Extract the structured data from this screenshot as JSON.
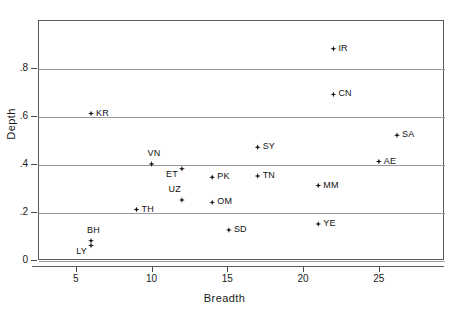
{
  "chart_data": {
    "type": "scatter",
    "title": "",
    "xlabel": "Breadth",
    "ylabel": "Depth",
    "xlim": [
      2.5,
      29.3
    ],
    "ylim": [
      -0.02,
      1.0
    ],
    "grid": "horizontal",
    "legend": "none",
    "xticks": [
      5,
      10,
      15,
      20,
      25
    ],
    "xtick_labels": [
      "5",
      "10",
      "15",
      "20",
      "25"
    ],
    "yticks": [
      0,
      0.2,
      0.4,
      0.6,
      0.8
    ],
    "ytick_labels": [
      "0",
      ".2",
      ".4",
      ".6",
      ".8"
    ],
    "marker": "filled-diamond",
    "marker_color": "#111111",
    "points": [
      {
        "label": "IR",
        "x": 22.0,
        "y": 0.88,
        "anchor": "right"
      },
      {
        "label": "CN",
        "x": 22.0,
        "y": 0.69,
        "anchor": "right"
      },
      {
        "label": "KR",
        "x": 6.0,
        "y": 0.61,
        "anchor": "right"
      },
      {
        "label": "SA",
        "x": 26.2,
        "y": 0.52,
        "anchor": "right"
      },
      {
        "label": "SY",
        "x": 17.0,
        "y": 0.47,
        "anchor": "right"
      },
      {
        "label": "VN",
        "x": 10.0,
        "y": 0.4,
        "anchor": "above"
      },
      {
        "label": "AE",
        "x": 25.0,
        "y": 0.41,
        "anchor": "right"
      },
      {
        "label": "ET",
        "x": 12.0,
        "y": 0.38,
        "anchor": "belowleft"
      },
      {
        "label": "TN",
        "x": 17.0,
        "y": 0.35,
        "anchor": "right"
      },
      {
        "label": "PK",
        "x": 14.0,
        "y": 0.345,
        "anchor": "right"
      },
      {
        "label": "MM",
        "x": 21.0,
        "y": 0.31,
        "anchor": "right"
      },
      {
        "label": "UZ",
        "x": 12.0,
        "y": 0.25,
        "anchor": "aboveleft"
      },
      {
        "label": "OM",
        "x": 14.0,
        "y": 0.24,
        "anchor": "right"
      },
      {
        "label": "TH",
        "x": 9.0,
        "y": 0.21,
        "anchor": "right"
      },
      {
        "label": "YE",
        "x": 21.0,
        "y": 0.15,
        "anchor": "right"
      },
      {
        "label": "SD",
        "x": 15.1,
        "y": 0.125,
        "anchor": "right"
      },
      {
        "label": "BH",
        "x": 6.0,
        "y": 0.08,
        "anchor": "above"
      },
      {
        "label": "LY",
        "x": 6.0,
        "y": 0.06,
        "anchor": "belowleft"
      }
    ]
  },
  "axes": {
    "y_title": "Depth",
    "x_title": "Breadth"
  }
}
